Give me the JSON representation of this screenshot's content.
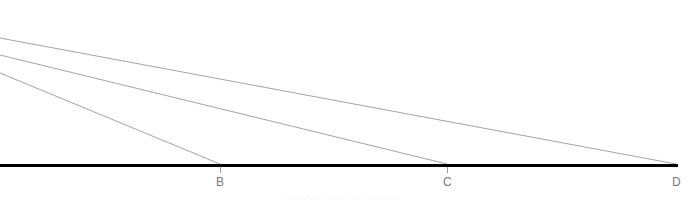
{
  "figure": {
    "kind": "geometry-diagram",
    "width": 690,
    "height": 202,
    "background_color": "#ffffff",
    "baseline": {
      "name": "baseline-AD",
      "color": "#000000",
      "thickness": 3,
      "x_start": 0,
      "x_end": 678,
      "y": 165
    },
    "ray_color": "#8c8c8c",
    "ray_thickness": 0.8,
    "rays": [
      {
        "id": "ray-to-D",
        "x1": 0,
        "y1": 38,
        "x2": 676,
        "y2": 164,
        "target_label": "D"
      },
      {
        "id": "ray-to-C",
        "x1": 0,
        "y1": 55,
        "x2": 447,
        "y2": 164,
        "target_label": "C"
      },
      {
        "id": "ray-to-B",
        "x1": 0,
        "y1": 73,
        "x2": 220,
        "y2": 164,
        "target_label": "B"
      }
    ],
    "points": [
      {
        "label": "B",
        "x": 220,
        "y": 165,
        "label_x": 216,
        "label_y": 176,
        "tick": true
      },
      {
        "label": "C",
        "x": 447,
        "y": 165,
        "label_x": 443,
        "label_y": 176,
        "tick": true
      },
      {
        "label": "D",
        "x": 676,
        "y": 165,
        "label_x": 672,
        "label_y": 176,
        "tick": false
      }
    ],
    "tick_color": "#9a9a9a",
    "caption": {
      "text": "·  ·· · ·· ··  ···· ·· ·· ·· ···· ··· ···· ···· · ··· ·",
      "y": 196
    }
  }
}
